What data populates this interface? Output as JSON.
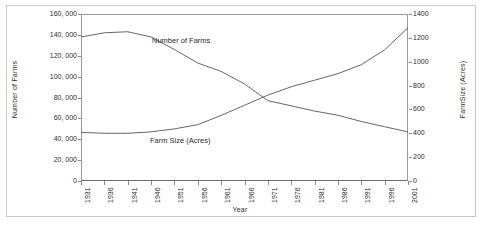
{
  "figure": {
    "background_color": "#ffffff",
    "border_color": "#c8c8c8",
    "line_color": "#555555"
  },
  "axes": {
    "x_title": "Year",
    "y_left_title": "Number of Farms",
    "y_right_title": "FarmSize (Acres)"
  },
  "series_labels": {
    "farms": "Number of Farms",
    "size": "Farm Size  (Acres)"
  },
  "chart_data": {
    "type": "line",
    "title": "",
    "xlabel": "Year",
    "ylabel": "Number of Farms",
    "y2label": "FarmSize (Acres)",
    "grid": false,
    "legend_position": "inline-annotation",
    "x": [
      1931,
      1936,
      1941,
      1946,
      1951,
      1956,
      1961,
      1966,
      1971,
      1976,
      1981,
      1986,
      1991,
      1996,
      2001
    ],
    "xtick_labels": [
      "1931",
      "1936",
      "1941",
      "1946",
      "1951",
      "1956",
      "1961",
      "1966",
      "1971",
      "1976",
      "1981",
      "1986",
      "1991",
      "1996",
      "2001"
    ],
    "ylim": [
      0,
      160000
    ],
    "ytick_values": [
      0,
      20000,
      40000,
      60000,
      80000,
      100000,
      120000,
      140000,
      160000
    ],
    "ytick_labels": [
      "0",
      "20, 000",
      "40, 000",
      "60, 000",
      "80, 000",
      "100, 000",
      "120, 000",
      "140, 000",
      "160, 000"
    ],
    "y2lim": [
      0,
      1400
    ],
    "y2tick_values": [
      0,
      200,
      400,
      600,
      800,
      1000,
      1200,
      1400
    ],
    "y2tick_labels": [
      "0",
      "200",
      "400",
      "600",
      "800",
      "1000",
      "1200",
      "1400"
    ],
    "series": [
      {
        "name": "Number of Farms",
        "axis": "left",
        "values": [
          138000,
          142000,
          143000,
          138000,
          126000,
          113000,
          105000,
          93000,
          77000,
          72000,
          67000,
          63000,
          57000,
          52000,
          47000
        ]
      },
      {
        "name": "Farm Size (Acres)",
        "axis": "right",
        "values": [
          408,
          400,
          400,
          412,
          437,
          472,
          550,
          635,
          720,
          790,
          845,
          900,
          975,
          1100,
          1285
        ]
      }
    ]
  }
}
